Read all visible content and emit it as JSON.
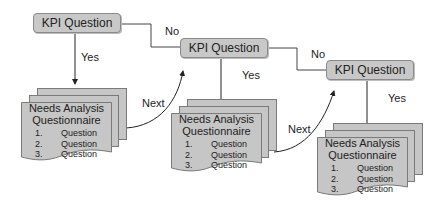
{
  "diagram": {
    "nodes": [
      {
        "id": "kpi1",
        "label": "KPI Question"
      },
      {
        "id": "kpi2",
        "label": "KPI Question"
      },
      {
        "id": "kpi3",
        "label": "KPI Question"
      }
    ],
    "questionnaires": [
      {
        "title_line1": "Needs Analysis",
        "title_line2": "Questionnaire",
        "items": [
          {
            "num": "1.",
            "text": "Question"
          },
          {
            "num": "2.",
            "text": "Question"
          },
          {
            "num": "3.",
            "text": "Question"
          }
        ]
      },
      {
        "title_line1": "Needs Analysis",
        "title_line2": "Questionnaire",
        "items": [
          {
            "num": "1.",
            "text": "Question"
          },
          {
            "num": "2.",
            "text": "Question"
          },
          {
            "num": "3.",
            "text": "Question"
          }
        ]
      },
      {
        "title_line1": "Needs Analysis",
        "title_line2": "Questionnaire",
        "items": [
          {
            "num": "1.",
            "text": "Question"
          },
          {
            "num": "2.",
            "text": "Question"
          },
          {
            "num": "3.",
            "text": "Question"
          }
        ]
      }
    ],
    "edge_labels": {
      "yes1": "Yes",
      "no1": "No",
      "next1": "Next",
      "yes2": "Yes",
      "no2": "No",
      "next2": "Next",
      "yes3": "Yes"
    },
    "colors": {
      "box_fill": "#c8c8c8",
      "box_border": "#8a8a8a",
      "line": "#333333"
    }
  }
}
